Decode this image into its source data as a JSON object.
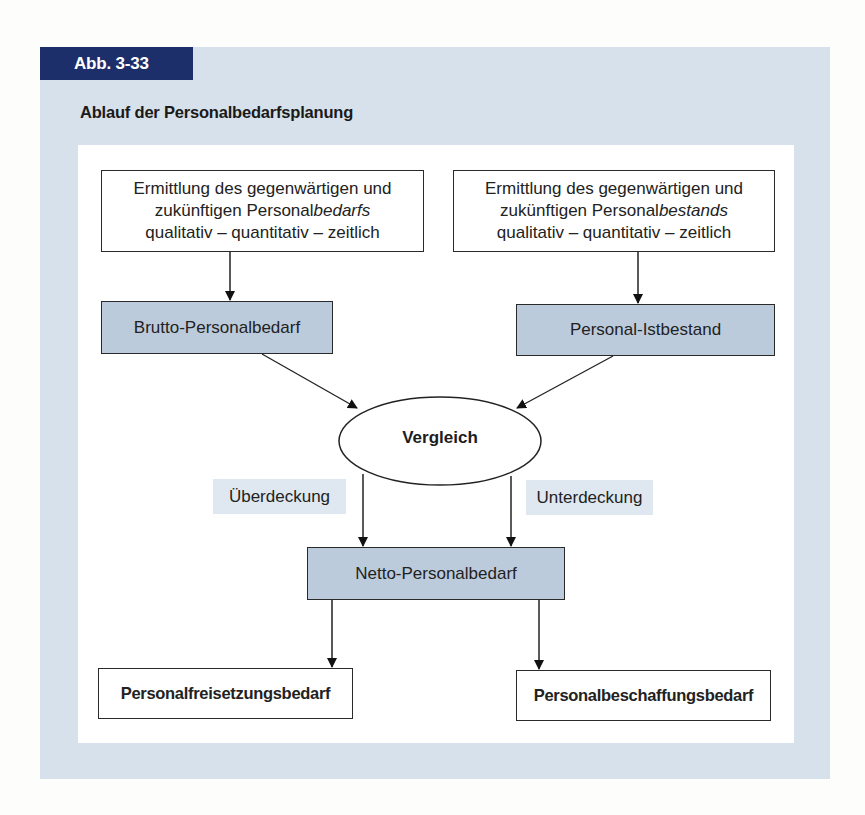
{
  "figure": {
    "badge": "Abb. 3-33",
    "title": "Ablauf der Personalbedarfsplanung",
    "colors": {
      "badge_bg": "#1d2f6a",
      "panel_bg": "#d7e1eb",
      "shaded_box": "#bccbdc",
      "label_chip": "#dfe8f0"
    }
  },
  "nodes": {
    "demand_analysis": {
      "line1": "Ermittlung des gegenwärtigen und",
      "line2_prefix": "zukünftigen Personal",
      "line2_italic": "bedarfs",
      "line3": "qualitativ – quantitativ – zeitlich"
    },
    "stock_analysis": {
      "line1": "Ermittlung des gegenwärtigen und",
      "line2_prefix": "zukünftigen Personal",
      "line2_italic": "bestands",
      "line3": "qualitativ – quantitativ – zeitlich"
    },
    "gross_demand": "Brutto-Personalbedarf",
    "actual_stock": "Personal-Istbestand",
    "comparison": "Vergleich",
    "net_demand": "Netto-Personalbedarf",
    "release_demand": "Personalfreisetzungsbedarf",
    "procurement_demand": "Personalbeschaffungsbedarf"
  },
  "edge_labels": {
    "surplus": "Überdeckung",
    "shortage": "Unterdeckung"
  }
}
